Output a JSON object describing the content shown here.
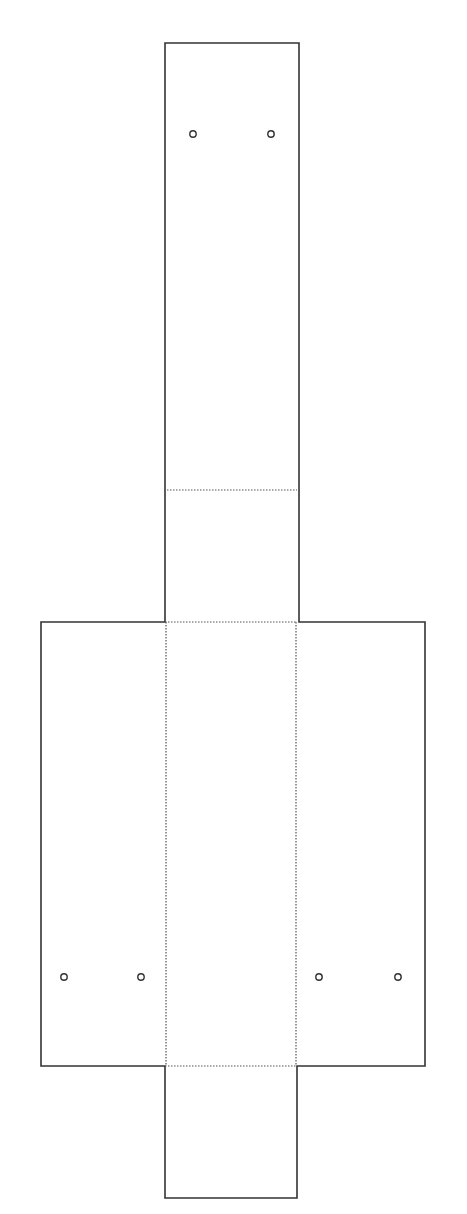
{
  "diagram": {
    "type": "box-template-net",
    "stroke_color": "#333333",
    "fold_color": "#555555",
    "background": "#ffffff",
    "panels": [
      {
        "name": "top-flap",
        "x": 165,
        "y": 43,
        "w": 134,
        "h": 579
      },
      {
        "name": "left-wing",
        "x": 41,
        "y": 622,
        "w": 124,
        "h": 444
      },
      {
        "name": "center-panel",
        "x": 165,
        "y": 622,
        "w": 131,
        "h": 444
      },
      {
        "name": "right-wing",
        "x": 296,
        "y": 622,
        "w": 129,
        "h": 444
      },
      {
        "name": "bottom-tab",
        "x": 165,
        "y": 1066,
        "w": 132,
        "h": 132
      }
    ],
    "fold_lines": [
      {
        "name": "top-flap-fold",
        "x1": 167,
        "y1": 490,
        "x2": 297,
        "y2": 490
      },
      {
        "name": "center-top-fold",
        "x1": 165,
        "y1": 622,
        "x2": 296,
        "y2": 622
      },
      {
        "name": "left-vertical-fold",
        "x1": 166,
        "y1": 622,
        "x2": 166,
        "y2": 1066
      },
      {
        "name": "right-vertical-fold",
        "x1": 296,
        "y1": 622,
        "x2": 296,
        "y2": 1066
      },
      {
        "name": "center-bottom-fold",
        "x1": 165,
        "y1": 1066,
        "x2": 297,
        "y2": 1066
      }
    ],
    "holes": [
      {
        "cx": 193,
        "cy": 134
      },
      {
        "cx": 271,
        "cy": 134
      },
      {
        "cx": 64,
        "cy": 977
      },
      {
        "cx": 141,
        "cy": 977
      },
      {
        "cx": 319,
        "cy": 977
      },
      {
        "cx": 398,
        "cy": 977
      }
    ]
  }
}
